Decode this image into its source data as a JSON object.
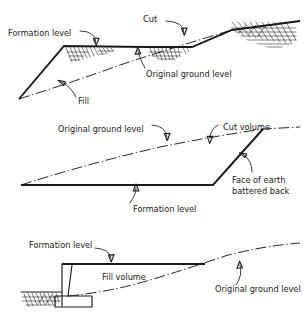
{
  "figure": {
    "background_color": "#ffffff",
    "line_color": "#1a1a1a",
    "panels": [
      {
        "id": "panel-top",
        "name": "cut-and-fill-section",
        "labels": [
          {
            "id": "formation-level",
            "text": "Formation level"
          },
          {
            "id": "cut",
            "text": "Cut"
          },
          {
            "id": "original-ground-level",
            "text": "Original ground level"
          },
          {
            "id": "fill",
            "text": "Fill"
          }
        ]
      },
      {
        "id": "panel-middle",
        "name": "cut-volume-section",
        "labels": [
          {
            "id": "original-ground-level",
            "text": "Original ground level"
          },
          {
            "id": "cut-volume",
            "text": "Cut volume"
          },
          {
            "id": "face-of-earth-line1",
            "text": "Face of earth"
          },
          {
            "id": "face-of-earth-line2",
            "text": "battered back"
          },
          {
            "id": "formation-level",
            "text": "Formation level"
          }
        ]
      },
      {
        "id": "panel-bottom",
        "name": "fill-volume-section",
        "labels": [
          {
            "id": "formation-level",
            "text": "Formation level"
          },
          {
            "id": "fill-volume",
            "text": "Fill volume"
          },
          {
            "id": "original-ground-level",
            "text": "Original ground level"
          }
        ]
      }
    ]
  }
}
